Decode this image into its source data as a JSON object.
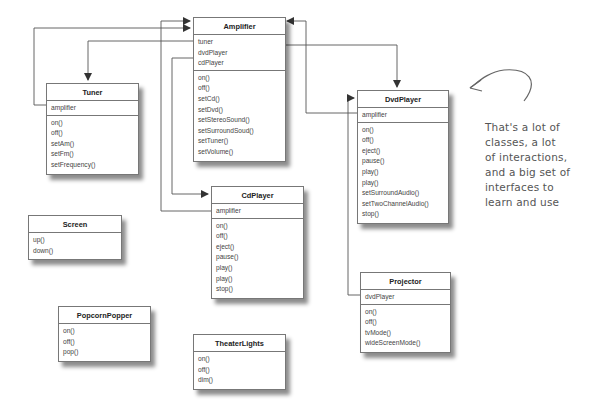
{
  "diagram": {
    "type": "uml-class-diagram",
    "classes": {
      "amplifier": {
        "name": "Amplifier",
        "attributes": [
          "tuner",
          "dvdPlayer",
          "cdPlayer"
        ],
        "methods": [
          "on()",
          "off()",
          "setCd()",
          "setDvd()",
          "setStereoSound()",
          "setSurroundSoud()",
          "setTuner()",
          "setVolume()"
        ]
      },
      "tuner": {
        "name": "Tuner",
        "attributes": [
          "amplifier"
        ],
        "methods": [
          "on()",
          "off()",
          "setAm()",
          "setFm()",
          "setFrequency()"
        ]
      },
      "dvdPlayer": {
        "name": "DvdPlayer",
        "attributes": [
          "amplifier"
        ],
        "methods": [
          "on()",
          "off()",
          "eject()",
          "pause()",
          "play()",
          "play()",
          "setSurroundAudio()",
          "setTwoChannelAudio()",
          "stop()"
        ]
      },
      "cdPlayer": {
        "name": "CdPlayer",
        "attributes": [
          "amplifier"
        ],
        "methods": [
          "on()",
          "off()",
          "eject()",
          "pause()",
          "play()",
          "play()",
          "stop()"
        ]
      },
      "screen": {
        "name": "Screen",
        "methods": [
          "up()",
          "down()"
        ]
      },
      "popcornPopper": {
        "name": "PopcornPopper",
        "methods": [
          "on()",
          "off()",
          "pop()"
        ]
      },
      "theaterLights": {
        "name": "TheaterLights",
        "methods": [
          "on()",
          "off()",
          "dim()"
        ]
      },
      "projector": {
        "name": "Projector",
        "attributes": [
          "dvdPlayer"
        ],
        "methods": [
          "on()",
          "off()",
          "tvMode()",
          "wideScreenMode()"
        ]
      }
    },
    "relations": [
      {
        "from": "Amplifier.tuner",
        "to": "Tuner"
      },
      {
        "from": "Tuner.amplifier",
        "to": "Amplifier"
      },
      {
        "from": "Amplifier.dvdPlayer",
        "to": "DvdPlayer"
      },
      {
        "from": "DvdPlayer.amplifier",
        "to": "Amplifier"
      },
      {
        "from": "Amplifier.cdPlayer",
        "to": "CdPlayer"
      },
      {
        "from": "CdPlayer.amplifier",
        "to": "Amplifier"
      },
      {
        "from": "Projector.dvdPlayer",
        "to": "DvdPlayer"
      }
    ],
    "annotation": {
      "lines": [
        "That's a lot of",
        "classes, a lot",
        "of interactions,",
        "and a big set of",
        "interfaces to",
        "learn and use"
      ]
    },
    "colors": {
      "line": "#555555",
      "border": "#777777",
      "text": "#444444"
    }
  }
}
